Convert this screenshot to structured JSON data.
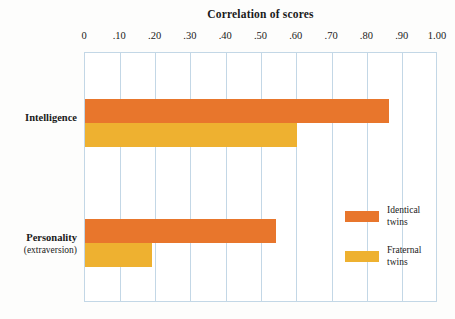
{
  "chart_data": {
    "type": "bar",
    "orientation": "horizontal",
    "title": "Correlation of scores",
    "xlabel": "",
    "ylabel": "",
    "xlim": [
      0,
      1.0
    ],
    "grid": true,
    "legend_position": "inside-right",
    "categories": [
      {
        "label": "Intelligence",
        "sublabel": ""
      },
      {
        "label": "Personality",
        "sublabel": "(extraversion)"
      }
    ],
    "series": [
      {
        "name": "Identical twins",
        "color": "#e8762c",
        "values": [
          0.86,
          0.54
        ]
      },
      {
        "name": "Fraternal twins",
        "color": "#eeb130",
        "values": [
          0.6,
          0.19
        ]
      }
    ],
    "x_ticks": [
      {
        "value": 0.0,
        "label": "0"
      },
      {
        "value": 0.1,
        "label": ".10"
      },
      {
        "value": 0.2,
        "label": ".20"
      },
      {
        "value": 0.3,
        "label": ".30"
      },
      {
        "value": 0.4,
        "label": ".40"
      },
      {
        "value": 0.5,
        "label": ".50"
      },
      {
        "value": 0.6,
        "label": ".60"
      },
      {
        "value": 0.7,
        "label": ".70"
      },
      {
        "value": 0.8,
        "label": ".80"
      },
      {
        "value": 0.9,
        "label": ".90"
      },
      {
        "value": 1.0,
        "label": "1.00"
      }
    ],
    "colors": {
      "identical": "#e8762c",
      "fraternal": "#eeb130",
      "gridline": "#c3d7e6",
      "frame": "#c3d7e6",
      "background": "#fdfdfc",
      "text": "#1a1a1a"
    }
  }
}
